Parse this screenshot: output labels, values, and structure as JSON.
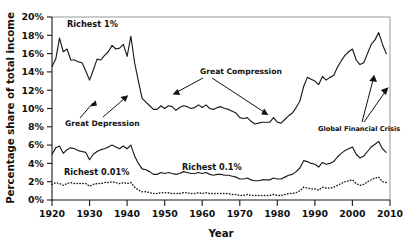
{
  "chart_data": {
    "type": "line",
    "title": "",
    "xlabel": "Year",
    "ylabel": "Percentage share of total income",
    "xlim": [
      1920,
      2010
    ],
    "ylim": [
      0,
      20
    ],
    "grid": false,
    "legend_position": "inline-labels",
    "xticks": [
      "1920",
      "1930",
      "1940",
      "1950",
      "1960",
      "1970",
      "1980",
      "1990",
      "2000",
      "2010"
    ],
    "yticks": [
      "0%",
      "2%",
      "4%",
      "6%",
      "8%",
      "10%",
      "12%",
      "14%",
      "16%",
      "18%",
      "20%"
    ],
    "x": [
      1920,
      1921,
      1922,
      1923,
      1924,
      1925,
      1926,
      1927,
      1928,
      1929,
      1930,
      1931,
      1932,
      1933,
      1934,
      1935,
      1936,
      1937,
      1938,
      1939,
      1940,
      1941,
      1942,
      1943,
      1944,
      1945,
      1946,
      1947,
      1948,
      1949,
      1950,
      1951,
      1952,
      1953,
      1954,
      1955,
      1956,
      1957,
      1958,
      1959,
      1960,
      1961,
      1962,
      1963,
      1964,
      1965,
      1966,
      1967,
      1968,
      1969,
      1970,
      1971,
      1972,
      1973,
      1974,
      1975,
      1976,
      1977,
      1978,
      1979,
      1980,
      1981,
      1982,
      1983,
      1984,
      1985,
      1986,
      1987,
      1988,
      1989,
      1990,
      1991,
      1992,
      1993,
      1994,
      1995,
      1996,
      1997,
      1998,
      1999,
      2000,
      2001,
      2002,
      2003,
      2004,
      2005,
      2006,
      2007,
      2008,
      2009
    ],
    "series": [
      {
        "name": "Richest 1%",
        "style": "solid",
        "label_text": "Richest 1%",
        "values": [
          14.6,
          15.4,
          17.7,
          16.2,
          16.5,
          15.3,
          15.3,
          15.1,
          15.0,
          14.1,
          13.1,
          14.2,
          15.4,
          15.3,
          15.8,
          16.2,
          16.9,
          16.5,
          16.6,
          17.0,
          15.7,
          17.9,
          15.0,
          13.0,
          11.1,
          10.7,
          10.3,
          9.9,
          9.9,
          10.3,
          10.0,
          10.3,
          10.2,
          9.8,
          10.1,
          10.3,
          10.2,
          10.0,
          10.1,
          10.4,
          10.1,
          10.4,
          10.0,
          9.9,
          10.1,
          10.2,
          10.0,
          9.9,
          9.7,
          9.5,
          9.0,
          8.9,
          9.0,
          8.6,
          8.3,
          8.4,
          8.5,
          8.5,
          8.5,
          9.0,
          8.5,
          8.4,
          8.8,
          9.2,
          9.5,
          10.1,
          10.8,
          12.4,
          13.4,
          13.2,
          13.0,
          12.6,
          13.5,
          13.1,
          13.4,
          13.6,
          14.5,
          15.2,
          15.8,
          16.2,
          16.5,
          15.3,
          14.8,
          15.0,
          16.0,
          17.0,
          17.5,
          18.3,
          17.0,
          16.0
        ]
      },
      {
        "name": "Richest 0.1%",
        "style": "solid",
        "label_text": "Richest 0.1%",
        "values": [
          5.0,
          5.7,
          5.9,
          5.1,
          5.5,
          5.7,
          5.6,
          5.4,
          5.3,
          5.2,
          4.4,
          5.0,
          5.3,
          5.5,
          5.6,
          5.8,
          6.0,
          5.8,
          5.6,
          5.9,
          5.6,
          6.0,
          4.8,
          4.0,
          3.4,
          3.3,
          3.1,
          2.8,
          2.8,
          3.0,
          2.9,
          3.0,
          2.9,
          2.8,
          2.9,
          3.1,
          3.0,
          2.9,
          2.9,
          3.0,
          2.9,
          3.0,
          2.8,
          2.7,
          2.8,
          2.8,
          2.7,
          2.7,
          2.6,
          2.5,
          2.3,
          2.3,
          2.4,
          2.2,
          2.1,
          2.1,
          2.2,
          2.2,
          2.2,
          2.4,
          2.3,
          2.3,
          2.5,
          2.7,
          2.8,
          3.1,
          3.5,
          4.3,
          4.2,
          4.0,
          3.9,
          3.6,
          4.1,
          3.9,
          4.0,
          4.2,
          4.7,
          5.1,
          5.4,
          5.6,
          5.8,
          5.0,
          4.6,
          4.8,
          5.3,
          5.8,
          6.1,
          6.4,
          5.6,
          5.2
        ]
      },
      {
        "name": "Richest 0.01%",
        "style": "dotted",
        "label_text": "Richest 0.01%",
        "values": [
          1.7,
          1.9,
          1.8,
          1.6,
          1.8,
          1.9,
          1.8,
          1.8,
          1.8,
          1.8,
          1.5,
          1.7,
          1.8,
          1.8,
          1.9,
          1.9,
          2.0,
          1.9,
          1.8,
          1.9,
          1.8,
          1.9,
          1.4,
          1.1,
          0.9,
          0.9,
          0.8,
          0.7,
          0.7,
          0.8,
          0.8,
          0.8,
          0.7,
          0.7,
          0.7,
          0.8,
          0.8,
          0.7,
          0.7,
          0.8,
          0.7,
          0.8,
          0.7,
          0.7,
          0.7,
          0.7,
          0.7,
          0.7,
          0.6,
          0.6,
          0.5,
          0.5,
          0.6,
          0.5,
          0.5,
          0.5,
          0.5,
          0.5,
          0.5,
          0.6,
          0.5,
          0.5,
          0.6,
          0.7,
          0.7,
          0.8,
          1.0,
          1.4,
          1.3,
          1.2,
          1.2,
          1.1,
          1.4,
          1.3,
          1.3,
          1.4,
          1.6,
          1.8,
          2.0,
          2.1,
          2.2,
          1.8,
          1.6,
          1.7,
          2.0,
          2.2,
          2.4,
          2.5,
          2.0,
          1.9
        ]
      }
    ],
    "annotations": [
      {
        "text": "Great Depression",
        "name": "great-depression"
      },
      {
        "text": "Great Compression",
        "name": "great-compression"
      },
      {
        "text": "Global Financial Crisis",
        "name": "global-financial-crisis"
      }
    ]
  }
}
